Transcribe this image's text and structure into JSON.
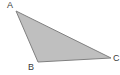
{
  "figure": {
    "name": "triangle-abc",
    "canvas": {
      "width": 120,
      "height": 75,
      "background_color": "#ffffff"
    },
    "shape": {
      "type": "triangle",
      "fill_color": "#bfbfbf",
      "stroke_color": "#808080",
      "stroke_width": 1,
      "points": "16,11 38,62 111,58",
      "vertices": [
        {
          "id": "A",
          "x": 16,
          "y": 11
        },
        {
          "id": "B",
          "x": 38,
          "y": 62
        },
        {
          "id": "C",
          "x": 111,
          "y": 58
        }
      ]
    },
    "labels": {
      "a": "A",
      "b": "B",
      "c": "C"
    },
    "label_color": "#3a3a3a"
  }
}
